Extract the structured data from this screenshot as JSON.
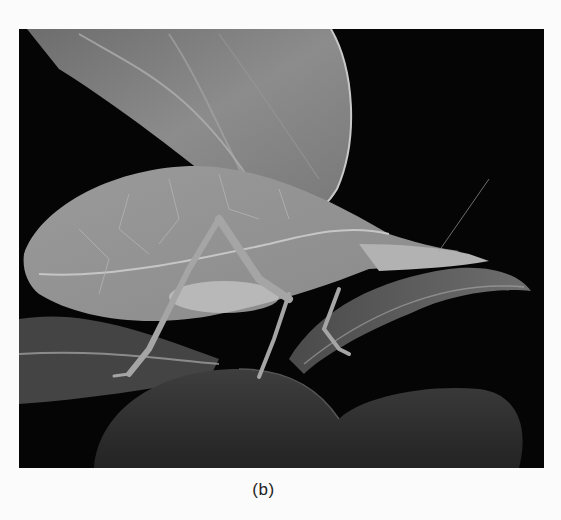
{
  "figure": {
    "caption": "(b)",
    "photo": {
      "subject": "leaf-mimic katydid on leaves",
      "style": "grayscale photograph",
      "background_color": "#050505",
      "leaf_tone": "#8a8a8a",
      "insect_tone": "#a3a3a3"
    }
  }
}
